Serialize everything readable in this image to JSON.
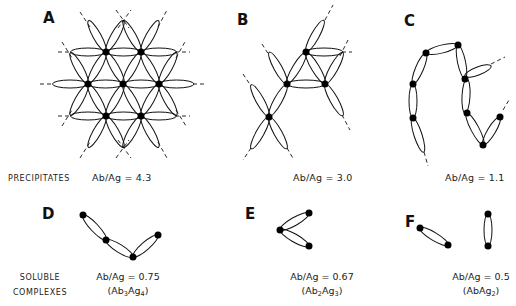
{
  "panels": [
    {
      "id": "A",
      "ratio": "Ab/Ag = 4.3"
    },
    {
      "id": "B",
      "ratio": "Ab/Ag = 3.0"
    },
    {
      "id": "C",
      "ratio": "Ab/Ag = 1.1"
    },
    {
      "id": "D",
      "ratio": "Ab/Ag = 0.75",
      "formula": {
        "ab": "Ab",
        "ab_sub": "3",
        "ag": "Ag",
        "ag_sub": "4"
      }
    },
    {
      "id": "E",
      "ratio": "Ab/Ag = 0.67",
      "formula": {
        "ab": "Ab",
        "ab_sub": "2",
        "ag": "Ag",
        "ag_sub": "3"
      }
    },
    {
      "id": "F",
      "ratio": "Ab/Ag = 0.5",
      "formula": {
        "ab": "AbAg",
        "ab_sub": "",
        "ag": "",
        "ag_sub": "2"
      }
    }
  ],
  "row_labels": {
    "precipitates": "PRECIPITATES",
    "soluble_line1": "SOLUBLE",
    "soluble_line2": "COMPLEXES"
  },
  "colors": {
    "ink": "#111111",
    "background": "#ffffff"
  }
}
